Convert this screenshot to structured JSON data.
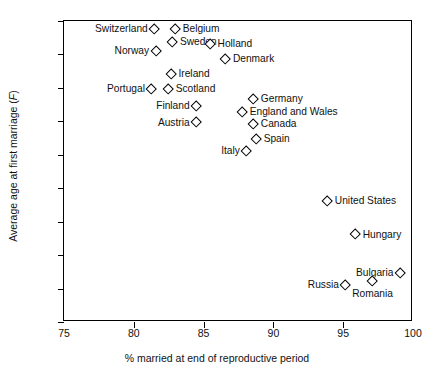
{
  "chart_data": {
    "type": "scatter",
    "title": "",
    "xlabel": "% married at end of reproductive period",
    "ylabel": "Average age at first marriage (F)",
    "ylabel_plain": "Average age at first marriage",
    "ylabel_italic": "F",
    "xlim": [
      75,
      100
    ],
    "ylim": [
      19,
      28
    ],
    "xticks": [
      75,
      80,
      85,
      90,
      95,
      100
    ],
    "yticks": [
      19,
      20,
      21,
      22,
      23,
      24,
      25,
      26,
      27,
      28
    ],
    "grid": false,
    "legend": "none",
    "marker": "open-diamond",
    "points": [
      {
        "label": "Switzerland",
        "x": 81.5,
        "y": 27.75,
        "side": "left"
      },
      {
        "label": "Belgium",
        "x": 83.0,
        "y": 27.75,
        "side": "right"
      },
      {
        "label": "Norway",
        "x": 81.6,
        "y": 27.1,
        "side": "left"
      },
      {
        "label": "Sweden",
        "x": 82.8,
        "y": 27.35,
        "side": "right"
      },
      {
        "label": "Holland",
        "x": 85.5,
        "y": 27.3,
        "side": "right"
      },
      {
        "label": "Denmark",
        "x": 86.6,
        "y": 26.85,
        "side": "right"
      },
      {
        "label": "Ireland",
        "x": 82.7,
        "y": 26.4,
        "side": "right"
      },
      {
        "label": "Portugal",
        "x": 81.3,
        "y": 25.95,
        "side": "left"
      },
      {
        "label": "Scotland",
        "x": 82.5,
        "y": 25.95,
        "side": "right"
      },
      {
        "label": "Finland",
        "x": 84.5,
        "y": 25.45,
        "side": "left"
      },
      {
        "label": "Austria",
        "x": 84.5,
        "y": 24.95,
        "side": "left"
      },
      {
        "label": "Germany",
        "x": 88.6,
        "y": 25.65,
        "side": "right"
      },
      {
        "label": "England and Wales",
        "x": 87.8,
        "y": 25.25,
        "side": "right"
      },
      {
        "label": "Canada",
        "x": 88.6,
        "y": 24.9,
        "side": "right"
      },
      {
        "label": "Spain",
        "x": 88.8,
        "y": 24.45,
        "side": "right"
      },
      {
        "label": "Italy",
        "x": 88.1,
        "y": 24.1,
        "side": "left"
      },
      {
        "label": "United States",
        "x": 93.9,
        "y": 22.6,
        "side": "right"
      },
      {
        "label": "Hungary",
        "x": 95.9,
        "y": 21.6,
        "side": "right"
      },
      {
        "label": "Bulgaria",
        "x": 99.1,
        "y": 20.45,
        "side": "left"
      },
      {
        "label": "Romania",
        "x": 97.1,
        "y": 20.2,
        "side": "below"
      },
      {
        "label": "Russia",
        "x": 95.2,
        "y": 20.1,
        "side": "left"
      }
    ]
  }
}
